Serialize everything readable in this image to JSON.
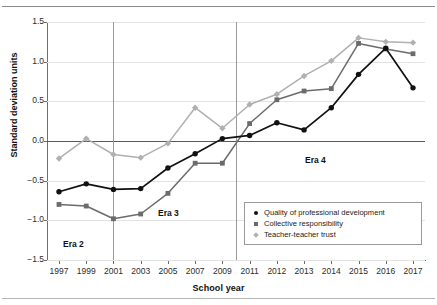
{
  "axis": {
    "x_title": "School year",
    "y_title": "Standard deviation units",
    "y_ticks": [
      "1.5",
      "1.0",
      "0.5",
      "0.0",
      "-0.5",
      "-1.0",
      "-1.5"
    ],
    "x_ticks": [
      "1997",
      "1999",
      "2001",
      "2003",
      "2005",
      "2007",
      "2009",
      "2011",
      "2012",
      "2013",
      "2014",
      "2015",
      "2016",
      "2017"
    ]
  },
  "legend": {
    "items": [
      {
        "label": "Quality of professional development",
        "marker": "circle-marker",
        "color": "#111111"
      },
      {
        "label": "Collective responsibility",
        "marker": "square-marker",
        "color": "#6b6b6b"
      },
      {
        "label": "Teacher-teacher trust",
        "marker": "diamond-marker",
        "color": "#b0b0b0"
      }
    ]
  },
  "annotations": [
    {
      "name": "era-2-label",
      "text": "Era 2"
    },
    {
      "name": "era-3-label",
      "text": "Era 3"
    },
    {
      "name": "era-4-label",
      "text": "Era 4"
    }
  ],
  "chart_data": {
    "type": "line",
    "title": "",
    "xlabel": "School year",
    "ylabel": "Standard deviation units",
    "categories": [
      "1997",
      "1999",
      "2001",
      "2003",
      "2005",
      "2007",
      "2009",
      "2011",
      "2012",
      "2013",
      "2014",
      "2015",
      "2016",
      "2017"
    ],
    "ylim": [
      -1.5,
      1.5
    ],
    "ytick_values": [
      1.5,
      1.0,
      0.5,
      0.0,
      -0.5,
      -1.0,
      -1.5
    ],
    "grid": true,
    "legend_position": "inside-lower-right",
    "zero_reference_line": 0.0,
    "era_dividers": [
      {
        "label": "Era 2 / Era 3 boundary",
        "at_category": "2001"
      },
      {
        "label": "Era 3 / Era 4 boundary",
        "at_category": "2010"
      }
    ],
    "series": [
      {
        "name": "Quality of professional development",
        "marker": "circle",
        "color": "#111111",
        "values": [
          -0.64,
          -0.54,
          -0.61,
          -0.6,
          -0.34,
          -0.16,
          0.03,
          0.07,
          0.23,
          0.14,
          0.42,
          0.84,
          1.17,
          0.67
        ]
      },
      {
        "name": "Collective responsibility",
        "marker": "square",
        "color": "#6b6b6b",
        "values": [
          -0.8,
          -0.82,
          -0.98,
          -0.92,
          -0.66,
          -0.28,
          -0.28,
          0.22,
          0.52,
          0.63,
          0.66,
          1.23,
          1.16,
          1.1
        ]
      },
      {
        "name": "Teacher-teacher trust",
        "marker": "diamond",
        "color": "#b0b0b0",
        "values": [
          -0.22,
          0.03,
          -0.17,
          -0.21,
          -0.03,
          0.42,
          0.16,
          0.46,
          0.59,
          0.82,
          1.01,
          1.3,
          1.25,
          1.24
        ]
      }
    ]
  }
}
